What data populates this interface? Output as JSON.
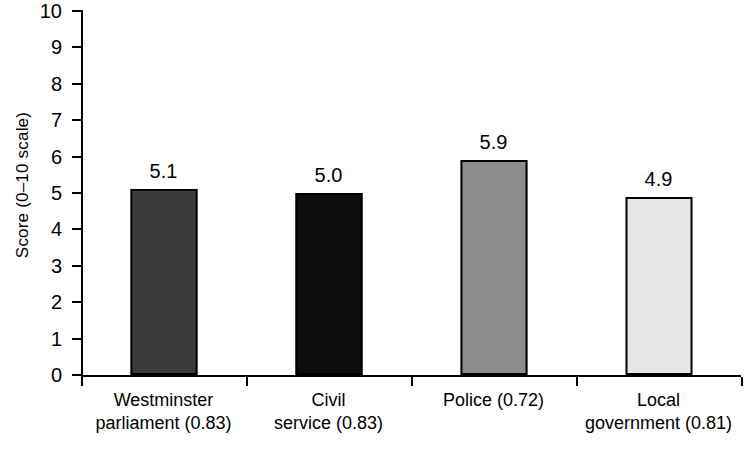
{
  "chart_data": {
    "type": "bar",
    "title": "",
    "subtitle": "",
    "xlabel": "",
    "ylabel": "Score (0–10 scale)",
    "ylim": [
      0,
      10
    ],
    "ytick_labels": [
      "0",
      "1",
      "2",
      "3",
      "4",
      "5",
      "6",
      "7",
      "8",
      "9",
      "10"
    ],
    "ytick_values": [
      0,
      1,
      2,
      3,
      4,
      5,
      6,
      7,
      8,
      9,
      10
    ],
    "grid": false,
    "legend": null,
    "categories": [
      "Westminster parliament (0.83)",
      "Civil service (0.83)",
      "Police (0.72)",
      "Local government (0.81)"
    ],
    "category_lines": [
      [
        "Westminster",
        "parliament (0.83)"
      ],
      [
        "Civil",
        "service (0.83)"
      ],
      [
        "Police (0.72)"
      ],
      [
        "Local",
        "government (0.81)"
      ]
    ],
    "values": [
      5.1,
      5.0,
      5.9,
      4.9
    ],
    "value_labels": [
      "5.1",
      "5.0",
      "5.9",
      "4.9"
    ],
    "bar_colors": [
      "#3b3b3b",
      "#0d0d0d",
      "#8c8c8c",
      "#e6e6e6"
    ],
    "bar_edge_color": "#000000"
  },
  "axis": {
    "line_color": "#000000"
  }
}
